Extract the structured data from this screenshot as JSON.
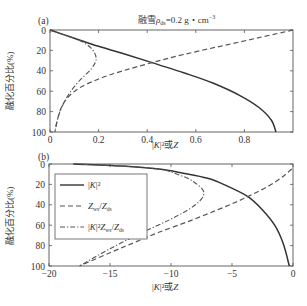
{
  "chart_data": [
    {
      "type": "line",
      "panel": "(a)",
      "title": "融雪ρ_ds=0.2 g・cm⁻³",
      "xlabel": "|K|²或Z",
      "ylabel": "融化百分比(%)",
      "xlim": [
        0,
        1.0
      ],
      "ylim": [
        100,
        0
      ],
      "y_inverted": true,
      "xticks": [
        "0",
        "0.2",
        "0.4",
        "0.6",
        "0.8"
      ],
      "yticks": [
        "0",
        "20",
        "40",
        "60",
        "80",
        "100"
      ],
      "grid": false,
      "series": [
        {
          "name": "|K|²",
          "style": "solid",
          "x": [
            0,
            0.1,
            0.2,
            0.3,
            0.42,
            0.55,
            0.67,
            0.78,
            0.86,
            0.91,
            0.93
          ],
          "y": [
            0,
            8,
            16,
            23,
            32,
            42,
            52,
            64,
            76,
            88,
            100
          ]
        },
        {
          "name": "Z_ws/Z_ds",
          "style": "dashed",
          "x": [
            1.0,
            0.85,
            0.7,
            0.55,
            0.42,
            0.3,
            0.2,
            0.12,
            0.07,
            0.04,
            0.02
          ],
          "y": [
            0,
            8,
            16,
            24,
            32,
            40,
            48,
            57,
            67,
            80,
            100
          ]
        },
        {
          "name": "|K|²Z_ws/Z_ds",
          "style": "dashdot",
          "x": [
            0,
            0.06,
            0.12,
            0.17,
            0.19,
            0.17,
            0.12,
            0.08,
            0.05,
            0.03,
            0.02
          ],
          "y": [
            0,
            5,
            10,
            18,
            28,
            38,
            50,
            62,
            75,
            88,
            100
          ]
        }
      ]
    },
    {
      "type": "line",
      "panel": "(b)",
      "title": "",
      "xlabel": "|K|²或Z",
      "ylabel": "融化百分比(%)",
      "xlim": [
        -20,
        0
      ],
      "ylim": [
        100,
        0
      ],
      "y_inverted": true,
      "xticks": [
        "-20",
        "-15",
        "-10",
        "-5",
        "0"
      ],
      "yticks": [
        "0",
        "20",
        "40",
        "60",
        "80",
        "100"
      ],
      "grid": false,
      "legend": {
        "position": "upper left",
        "entries": [
          "|K|²",
          "Z_ws/Z_ds",
          "|K|²Z_ws/Z_ds"
        ]
      },
      "series": [
        {
          "name": "|K|²",
          "style": "solid",
          "x": [
            -18,
            -14,
            -11,
            -9,
            -7,
            -5.5,
            -3.7,
            -2.5,
            -1.5,
            -0.8,
            -0.3
          ],
          "y": [
            0,
            2,
            5,
            9,
            14,
            21,
            32,
            45,
            60,
            78,
            100
          ]
        },
        {
          "name": "Z_ws/Z_ds",
          "style": "dashed",
          "x": [
            -0.1,
            -1.5,
            -3.7,
            -6,
            -8.5,
            -11,
            -13,
            -15,
            -17.5
          ],
          "y": [
            5,
            18,
            32,
            44,
            56,
            67,
            77,
            87,
            100
          ]
        },
        {
          "name": "|K|²Z_ws/Z_ds",
          "style": "dashdot",
          "x": [
            -18,
            -14,
            -11,
            -9.5,
            -8.2,
            -7.3,
            -8,
            -10,
            -12.5,
            -15,
            -17.5
          ],
          "y": [
            0,
            2,
            5,
            10,
            17,
            28,
            40,
            54,
            68,
            83,
            100
          ]
        }
      ]
    }
  ],
  "labels": {
    "panel_a": "(a)",
    "panel_b": "(b)",
    "title_prefix": "融雪",
    "title_rho": "ρ",
    "title_sub": "ds",
    "title_value": "=0.2 g・cm",
    "title_exp": "−3",
    "xlabel_a": "|K|²或Z",
    "xlabel_b": "|K|²或Z",
    "ylabel_a": "融化百分比(%)",
    "ylabel_b": "融化百分比(%)",
    "legend_1": "|K|²",
    "legend_2": "Z",
    "legend_2_sub": "ws",
    "legend_2_mid": "/Z",
    "legend_2_sub2": "ds",
    "legend_3": "|K|²Z",
    "legend_3_sub": "ws",
    "legend_3_mid": "/Z",
    "legend_3_sub2": "ds"
  }
}
